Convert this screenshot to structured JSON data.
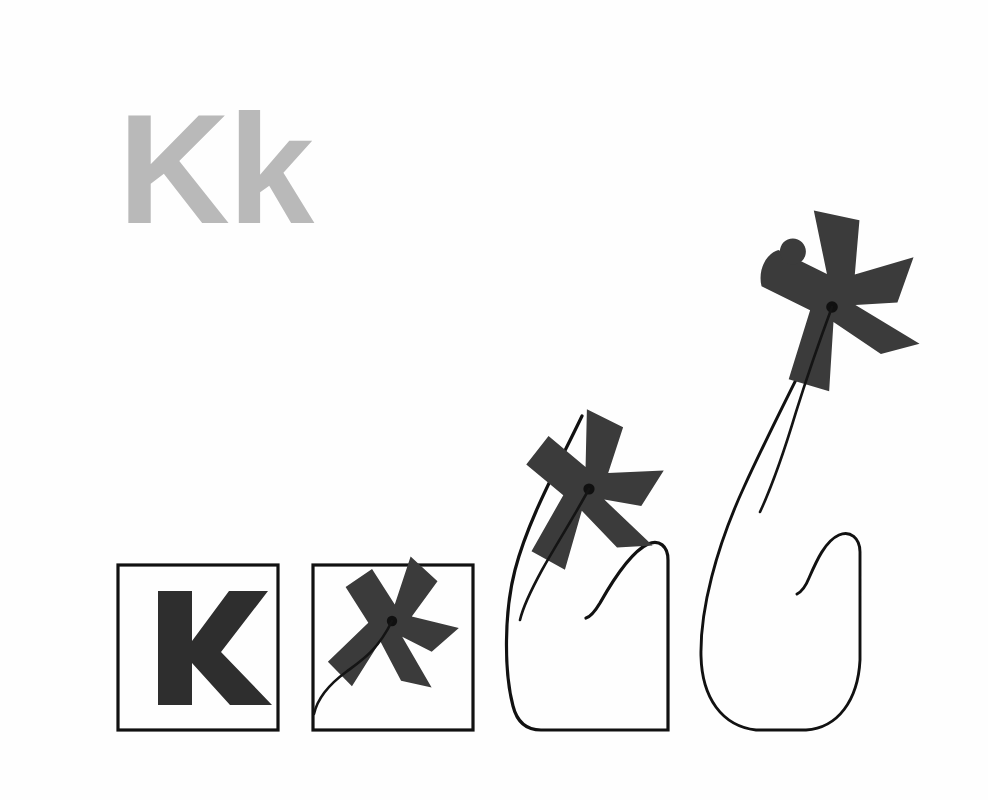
{
  "canvas": {
    "width": 988,
    "height": 800,
    "background_color": "#fefefe"
  },
  "title_label": {
    "text": "Kk",
    "color": "#b9b9b9",
    "description": "large light-gray bold letter pair in upper left"
  },
  "palette": {
    "ink": "#2a2a2a",
    "outline": "#111111",
    "paper": "#fefefe",
    "gray_letter": "#b9b9b9"
  },
  "illustration": {
    "kind": "letter-to-object morph sequence",
    "subject": "kite",
    "letter": "K",
    "panel_count": 4,
    "reading_order": "left-to-right, increasing transformation",
    "panels": [
      {
        "index": 1,
        "name": "panel-letter-k",
        "stage_label": "K",
        "frame_shape": "rectangle",
        "frame_intact": true,
        "figure": "letter K",
        "figure_rotation_deg": 0,
        "string_visible": false,
        "kite_lifted": false,
        "frame_box": {
          "x": 118,
          "y": 565,
          "width": 160,
          "height": 165
        }
      },
      {
        "index": 2,
        "name": "panel-k-becomes-kite",
        "stage_label": "K",
        "frame_shape": "rectangle",
        "frame_intact": true,
        "figure": "letter K rotated into kite silhouette with tail",
        "figure_rotation_deg": -40,
        "string_visible": true,
        "kite_lifted": false,
        "frame_box": {
          "x": 313,
          "y": 565,
          "width": 160,
          "height": 165
        }
      },
      {
        "index": 3,
        "name": "panel-kite-rising",
        "stage_label": "",
        "frame_shape": "distorted rectangle, top-left corner pulled upward",
        "frame_intact": false,
        "figure": "kite with swept wings and tail",
        "figure_rotation_deg": -55,
        "string_visible": true,
        "kite_lifted": true,
        "frame_box": {
          "x": 508,
          "y": 545,
          "width": 160,
          "height": 185
        }
      },
      {
        "index": 4,
        "name": "panel-kite-flying",
        "stage_label": "",
        "frame_shape": "fully curved balloon outline, corners dissolved",
        "frame_intact": false,
        "figure": "kite fully formed, bird-like swallow silhouette",
        "figure_rotation_deg": -70,
        "string_visible": true,
        "kite_lifted": true,
        "frame_box": {
          "x": 700,
          "y": 525,
          "width": 165,
          "height": 205
        }
      }
    ]
  }
}
